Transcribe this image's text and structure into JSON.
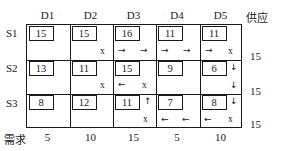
{
  "table": {
    "supply_header": "供应",
    "demand_header": "需求",
    "columns": [
      "D1",
      "D2",
      "D3",
      "D4",
      "D5"
    ],
    "rows": [
      "S1",
      "S2",
      "S3"
    ],
    "costs": [
      [
        15,
        15,
        16,
        11,
        11
      ],
      [
        13,
        11,
        15,
        9,
        6
      ],
      [
        8,
        12,
        11,
        7,
        8
      ]
    ],
    "supplies": [
      15,
      15,
      15
    ],
    "demands": [
      5,
      10,
      15,
      5,
      10
    ],
    "markers": {
      "s1": {
        "d2_x": "x",
        "d3_arrow_left": "→",
        "d3_arrow_right": "→",
        "d4_arrow_left": "→",
        "d4_arrow_right": "→",
        "d5_arrow": "→",
        "d5_x": "x"
      },
      "s2": {
        "d2_x": "x",
        "d3_arrow": "←",
        "d3_x": "x",
        "d5_arrow_top": "↓",
        "d5_arrow_bottom": "↓"
      },
      "s3": {
        "d3_arrow_up": "↑",
        "d3_x": "x",
        "d4_arrow_left": "←",
        "d4_arrow_right": "←",
        "d5_arrow_down": "↓",
        "d5_arrow_left": "←",
        "d5_x": "x"
      }
    }
  }
}
